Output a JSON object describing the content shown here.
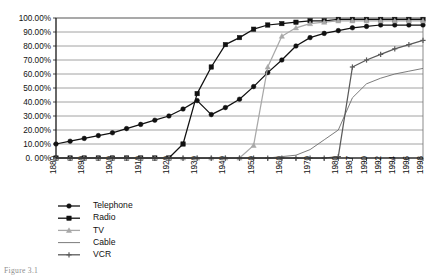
{
  "figure": {
    "caption": "Figure 3.1"
  },
  "chart_data": {
    "type": "line",
    "title": "",
    "xlabel": "",
    "ylabel": "",
    "ylim": [
      0,
      100
    ],
    "ytick_labels": [
      "0. 00%",
      "10.00%",
      "20.00%",
      "30.00%",
      "40.00%",
      "50.00%",
      "60.00%",
      "70.00%",
      "80.00%",
      "90.00%",
      "100.00%"
    ],
    "ytick_values": [
      0,
      10,
      20,
      30,
      40,
      50,
      60,
      70,
      80,
      90,
      100
    ],
    "xtick_labels": [
      "1880",
      "1890",
      "1900",
      "1910",
      "1920",
      "1930",
      "1940",
      "1950",
      "1960",
      "1970",
      "1980",
      "1987",
      "1990",
      "1992",
      "1994",
      "1996",
      "1998"
    ],
    "x": [
      1880,
      1885,
      1890,
      1895,
      1900,
      1905,
      1910,
      1915,
      1920,
      1925,
      1930,
      1935,
      1940,
      1945,
      1950,
      1955,
      1960,
      1965,
      1970,
      1975,
      1980,
      1987,
      1990,
      1992,
      1994,
      1996,
      1998
    ],
    "grid": true,
    "legend_position": "bottom-left",
    "series": [
      {
        "name": "Telephone",
        "marker": "circle",
        "color": "#111111",
        "values": [
          10,
          12,
          14,
          16,
          18,
          21,
          24,
          27,
          30,
          35,
          41,
          31,
          36,
          42,
          51,
          61,
          70,
          80,
          86,
          89,
          91,
          93,
          94,
          95,
          95,
          95,
          95
        ]
      },
      {
        "name": "Radio",
        "marker": "square",
        "color": "#111111",
        "values": [
          0,
          0,
          0,
          0,
          0,
          0,
          0,
          0,
          0,
          10,
          46,
          65,
          81,
          86,
          92,
          95,
          96,
          97,
          98,
          98,
          99,
          99,
          99,
          99,
          99,
          99,
          99
        ]
      },
      {
        "name": "TV",
        "marker": "triangle",
        "color": "#a8a8a8",
        "values": [
          0,
          0,
          0,
          0,
          0,
          0,
          0,
          0,
          0,
          0,
          0,
          0,
          0,
          0,
          9,
          65,
          87,
          93,
          96,
          97,
          98,
          98,
          98,
          98,
          98,
          98,
          98
        ]
      },
      {
        "name": "Cable",
        "marker": "none",
        "color": "#6d6d6d",
        "values": [
          0,
          0,
          0,
          0,
          0,
          0,
          0,
          0,
          0,
          0,
          0,
          0,
          0,
          0,
          0,
          0,
          1,
          2,
          6,
          13,
          20,
          43,
          53,
          57,
          60,
          62,
          64
        ]
      },
      {
        "name": "VCR",
        "marker": "cross",
        "color": "#5a5a5a",
        "values": [
          0,
          0,
          0,
          0,
          0,
          0,
          0,
          0,
          0,
          0,
          0,
          0,
          0,
          0,
          0,
          0,
          0,
          0,
          0,
          0,
          1,
          65,
          70,
          74,
          78,
          81,
          84
        ]
      }
    ]
  }
}
